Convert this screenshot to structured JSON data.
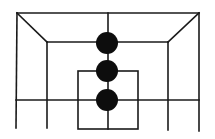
{
  "board": {
    "width": 215,
    "height": 139,
    "line_color": "#1a1a1a",
    "piece_color": "#0d0d0d",
    "lines": [
      {
        "name": "top-edge",
        "x1": 17,
        "y1": 13,
        "x2": 199,
        "y2": 13
      },
      {
        "name": "left-outer-vertical",
        "x1": 17,
        "y1": 13,
        "x2": 16,
        "y2": 128
      },
      {
        "name": "right-outer-vertical",
        "x1": 199,
        "y1": 13,
        "x2": 199,
        "y2": 131
      },
      {
        "name": "left-diagonal",
        "x1": 17,
        "y1": 13,
        "x2": 47,
        "y2": 42
      },
      {
        "name": "right-diagonal",
        "x1": 199,
        "y1": 13,
        "x2": 168,
        "y2": 42
      },
      {
        "name": "inner-top-horizontal",
        "x1": 47,
        "y1": 42,
        "x2": 168,
        "y2": 42
      },
      {
        "name": "left-inner-vertical",
        "x1": 47,
        "y1": 42,
        "x2": 47,
        "y2": 128
      },
      {
        "name": "right-inner-vertical",
        "x1": 168,
        "y1": 42,
        "x2": 168,
        "y2": 130
      },
      {
        "name": "center-vertical",
        "x1": 108,
        "y1": 13,
        "x2": 108,
        "y2": 129
      },
      {
        "name": "middle-horizontal",
        "x1": 16,
        "y1": 100,
        "x2": 199,
        "y2": 100
      }
    ],
    "inner_box": {
      "x": 78,
      "y": 71,
      "width": 60,
      "height": 58
    },
    "pieces": [
      {
        "name": "piece-top",
        "cx": 107,
        "cy": 43,
        "r": 11
      },
      {
        "name": "piece-middle",
        "cx": 107,
        "cy": 71,
        "r": 11
      },
      {
        "name": "piece-bottom",
        "cx": 107,
        "cy": 100,
        "r": 11
      }
    ]
  }
}
